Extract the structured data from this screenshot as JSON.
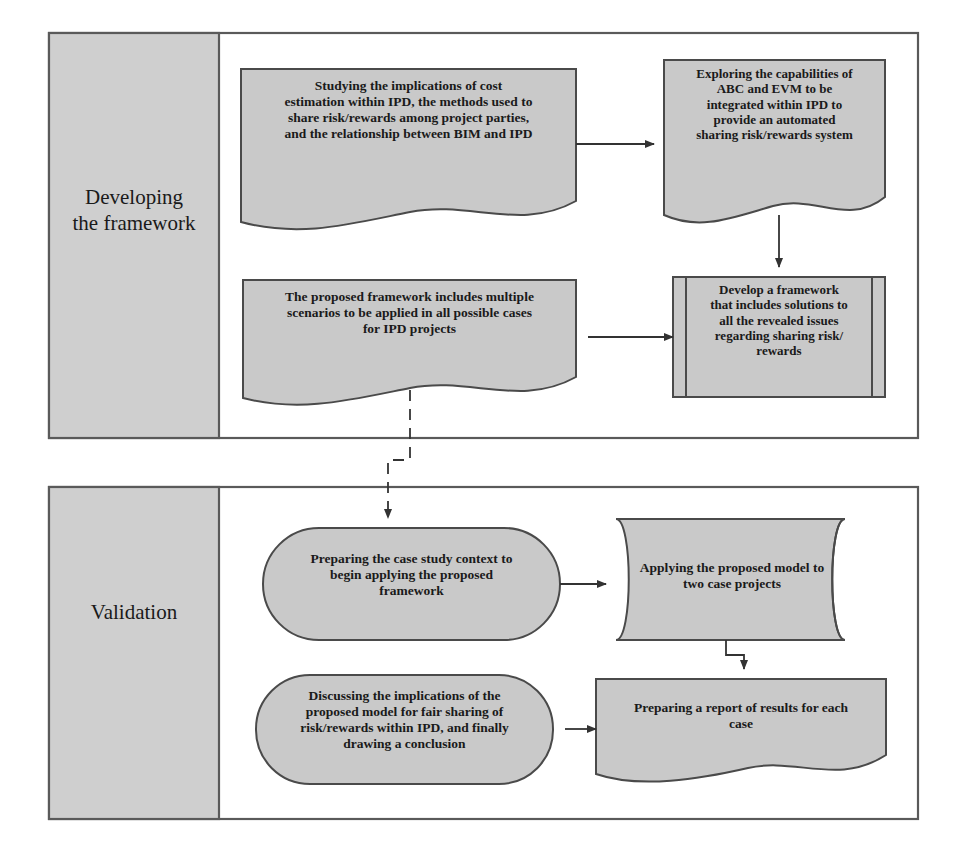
{
  "diagram": {
    "colors": {
      "shape_fill": "#c9c9c9",
      "panel_fill": "#cccccc",
      "stroke": "#4a4a4a",
      "container_stroke": "#5a5a5a",
      "text": "#1a1a1a",
      "background": "#ffffff"
    },
    "phases": [
      {
        "id": "phase-developing",
        "label": "Developing\nthe framework",
        "nodes": [
          {
            "id": "node-studying",
            "shape": "document",
            "text": "Studying the implications of cost\nestimation within IPD, the methods used to\nshare risk/rewards among project parties,\nand the relationship between BIM and IPD"
          },
          {
            "id": "node-exploring",
            "shape": "document",
            "text": "Exploring the capabilities of\nABC and EVM to be\nintegrated within IPD to\nprovide an automated\nsharing risk/rewards system"
          },
          {
            "id": "node-develop-framework",
            "shape": "predefined-process",
            "text": "Develop a framework\nthat includes solutions to\nall the revealed issues\nregarding sharing risk/\nrewards"
          },
          {
            "id": "node-proposed-framework",
            "shape": "document",
            "text": "The proposed framework includes multiple\nscenarios to be applied in all possible cases\nfor IPD projects"
          }
        ]
      },
      {
        "id": "phase-validation",
        "label": "Validation",
        "nodes": [
          {
            "id": "node-preparing-context",
            "shape": "terminator",
            "text": "Preparing the case study context to\nbegin applying the proposed\nframework"
          },
          {
            "id": "node-applying-model",
            "shape": "cylinder",
            "text": "Applying the proposed model to\ntwo case projects"
          },
          {
            "id": "node-preparing-report",
            "shape": "document",
            "text": "Preparing a report of results for each\ncase"
          },
          {
            "id": "node-discussing",
            "shape": "terminator",
            "text": "Discussing the implications of the\nproposed model for fair sharing of\nrisk/rewards within IPD, and finally\ndrawing a conclusion"
          }
        ]
      }
    ],
    "connectors": [
      {
        "id": "conn-studying-to-exploring",
        "from": "node-studying",
        "to": "node-exploring",
        "style": "solid",
        "arrow": "right"
      },
      {
        "id": "conn-exploring-to-develop",
        "from": "node-exploring",
        "to": "node-develop-framework",
        "style": "solid",
        "arrow": "down"
      },
      {
        "id": "conn-develop-to-proposed",
        "from": "node-develop-framework",
        "to": "node-proposed-framework",
        "style": "solid",
        "arrow": "left"
      },
      {
        "id": "conn-proposed-to-preparing",
        "from": "node-proposed-framework",
        "to": "node-preparing-context",
        "style": "dashed",
        "arrow": "down"
      },
      {
        "id": "conn-preparing-to-applying",
        "from": "node-preparing-context",
        "to": "node-applying-model",
        "style": "solid",
        "arrow": "right"
      },
      {
        "id": "conn-applying-to-report",
        "from": "node-applying-model",
        "to": "node-preparing-report",
        "style": "solid",
        "arrow": "down"
      },
      {
        "id": "conn-report-to-discussing",
        "from": "node-preparing-report",
        "to": "node-discussing",
        "style": "solid",
        "arrow": "left"
      }
    ]
  }
}
